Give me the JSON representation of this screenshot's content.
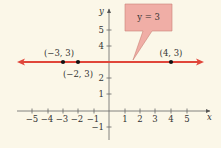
{
  "diagram": {
    "type": "coordinate-plane",
    "background": "#fbf7e8",
    "line_color": "#e0463a",
    "callout_fill": "#f0aea6",
    "callout_stroke": "#c98276",
    "axes": {
      "x_label": "x",
      "y_label": "y",
      "x_ticks": [
        "-5",
        "-4",
        "-3",
        "-2",
        "-1",
        "1",
        "2",
        "3",
        "4",
        "5"
      ],
      "y_ticks": [
        "5",
        "4",
        "2",
        "1",
        "-1"
      ]
    },
    "line": {
      "equation": "y = 3"
    },
    "points": [
      {
        "label": "(-3, 3)",
        "x": -3,
        "y": 3
      },
      {
        "label": "(-2, 3)",
        "x": -2,
        "y": 3
      },
      {
        "label": "(4, 3)",
        "x": 4,
        "y": 3
      }
    ]
  }
}
